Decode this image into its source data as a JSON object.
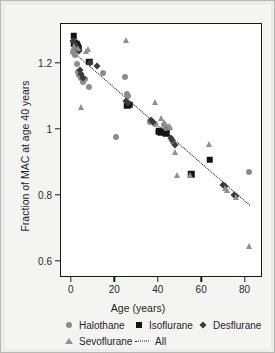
{
  "chart_data": {
    "type": "scatter",
    "title": "",
    "xlabel": "Age (years)",
    "ylabel": "Fraction of MAC at age 40 years",
    "xlim": [
      -5,
      88
    ],
    "ylim": [
      0.55,
      1.32
    ],
    "xticks": [
      0,
      20,
      40,
      60,
      80
    ],
    "xtick_labels": [
      "0",
      "20",
      "40",
      "60",
      "80"
    ],
    "yticks": [
      0.6,
      0.8,
      1.0,
      1.2
    ],
    "ytick_labels": [
      "0.6",
      "0.8",
      "1",
      "1.2"
    ],
    "grid": false,
    "legend_position": "below",
    "colors": {
      "halothane": "#8c8c8c",
      "isoflurane": "#141414",
      "desflurane": "#3a3a3a",
      "sevoflurane": "#8f8f8f",
      "trendline": "#1a1a1a",
      "plot_background": "#ffffff",
      "figure_background": "#f4f4f2"
    },
    "series": [
      {
        "name": "Halothane",
        "marker": "circle",
        "color": "#8c8c8c",
        "points": [
          [
            0.5,
            1.235
          ],
          [
            1.0,
            1.27
          ],
          [
            1.3,
            1.225
          ],
          [
            1.8,
            1.255
          ],
          [
            2.2,
            1.245
          ],
          [
            2.5,
            1.2
          ],
          [
            3.0,
            1.175
          ],
          [
            3.4,
            1.165
          ],
          [
            4.0,
            1.155
          ],
          [
            4.6,
            1.16
          ],
          [
            5.2,
            1.145
          ],
          [
            6.0,
            1.152
          ],
          [
            7.8,
            1.128
          ],
          [
            14.5,
            1.172
          ],
          [
            20.5,
            0.978
          ],
          [
            24.5,
            1.158
          ],
          [
            25.5,
            1.107
          ],
          [
            26.0,
            1.102
          ],
          [
            36.0,
            1.022
          ],
          [
            38.5,
            1.018
          ],
          [
            39.5,
            0.992
          ],
          [
            41.5,
            0.995
          ],
          [
            42.5,
            1.015
          ],
          [
            43.5,
            1.008
          ],
          [
            44.0,
            0.998
          ],
          [
            46.5,
            0.963
          ],
          [
            81.5,
            0.872
          ]
        ]
      },
      {
        "name": "Isoflurane",
        "marker": "square",
        "color": "#141414",
        "points": [
          [
            0.8,
            1.285
          ],
          [
            1.2,
            1.262
          ],
          [
            2.0,
            1.258
          ],
          [
            2.6,
            1.252
          ],
          [
            3.2,
            1.248
          ],
          [
            8.0,
            1.205
          ],
          [
            25.5,
            1.072
          ],
          [
            26.5,
            1.075
          ],
          [
            40.0,
            0.995
          ],
          [
            41.0,
            0.992
          ],
          [
            43.5,
            0.988
          ],
          [
            55.0,
            0.865
          ],
          [
            63.5,
            0.908
          ]
        ]
      },
      {
        "name": "Desflurane",
        "marker": "diamond",
        "color": "#3a3a3a",
        "points": [
          [
            0.6,
            1.268
          ],
          [
            1.5,
            1.258
          ],
          [
            2.3,
            1.245
          ],
          [
            3.1,
            1.238
          ],
          [
            3.8,
            1.182
          ],
          [
            4.4,
            1.168
          ],
          [
            5.0,
            1.155
          ],
          [
            8.5,
            1.202
          ],
          [
            11.5,
            1.192
          ],
          [
            25.0,
            1.088
          ],
          [
            25.8,
            1.082
          ],
          [
            36.5,
            1.028
          ],
          [
            37.5,
            1.022
          ],
          [
            44.5,
            1.005
          ],
          [
            45.5,
            0.975
          ],
          [
            46.0,
            0.968
          ],
          [
            47.5,
            0.952
          ],
          [
            69.5,
            0.832
          ],
          [
            70.5,
            0.828
          ],
          [
            74.5,
            0.802
          ],
          [
            75.5,
            0.798
          ]
        ]
      },
      {
        "name": "Sevoflurane",
        "marker": "triangle",
        "color": "#8f8f8f",
        "points": [
          [
            0.4,
            1.245
          ],
          [
            1.1,
            1.252
          ],
          [
            2.8,
            1.248
          ],
          [
            4.2,
            1.068
          ],
          [
            6.5,
            1.238
          ],
          [
            7.5,
            1.245
          ],
          [
            24.8,
            1.272
          ],
          [
            38.5,
            1.085
          ],
          [
            41.0,
            1.035
          ],
          [
            42.5,
            1.022
          ],
          [
            43.0,
            1.018
          ],
          [
            44.5,
            1.012
          ],
          [
            45.0,
            1.008
          ],
          [
            47.5,
            0.932
          ],
          [
            48.5,
            0.862
          ],
          [
            54.5,
            0.862
          ],
          [
            63.0,
            0.955
          ],
          [
            70.5,
            0.822
          ],
          [
            71.5,
            0.818
          ],
          [
            75.5,
            0.795
          ],
          [
            81.5,
            0.648
          ]
        ]
      }
    ],
    "trendline": {
      "name": "All",
      "style": "dotted",
      "color": "#1a1a1a",
      "x_start": 1.5,
      "y_start": 1.232,
      "x_end": 82.0,
      "y_end": 0.772
    }
  },
  "legend": {
    "entries": [
      {
        "label": "Halothane",
        "marker": "circle-marker"
      },
      {
        "label": "Isoflurane",
        "marker": "square-marker"
      },
      {
        "label": "Desflurane",
        "marker": "diamond-marker"
      },
      {
        "label": "Sevoflurane",
        "marker": "triangle-marker"
      },
      {
        "label": "All",
        "marker": "dotted-line-marker"
      }
    ]
  }
}
